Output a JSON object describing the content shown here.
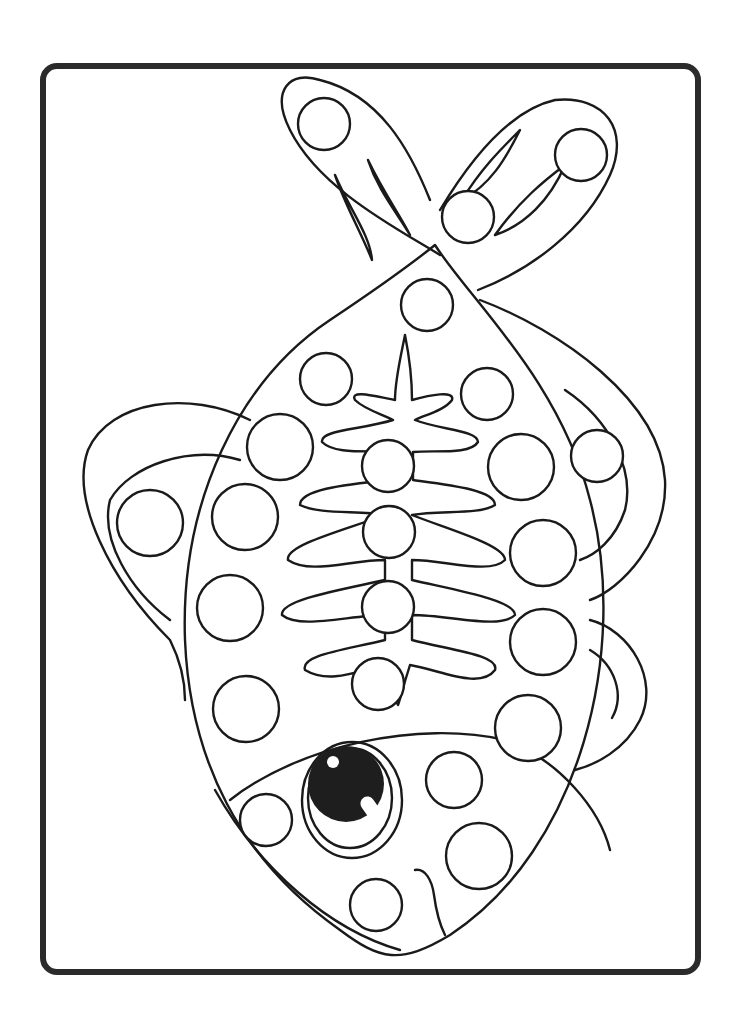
{
  "page": {
    "background": "#ffffff",
    "line_color": "#1a1a1a",
    "frame_color": "#2b2b2b"
  },
  "frame": {
    "x": 43,
    "y": 66,
    "width": 655,
    "height": 906,
    "radius": 14
  },
  "dots": [
    {
      "cx": 324,
      "cy": 124,
      "r": 26
    },
    {
      "cx": 581,
      "cy": 155,
      "r": 26
    },
    {
      "cx": 468,
      "cy": 217,
      "r": 26
    },
    {
      "cx": 427,
      "cy": 305,
      "r": 26
    },
    {
      "cx": 326,
      "cy": 379,
      "r": 26
    },
    {
      "cx": 487,
      "cy": 394,
      "r": 26
    },
    {
      "cx": 280,
      "cy": 447,
      "r": 33
    },
    {
      "cx": 521,
      "cy": 467,
      "r": 33
    },
    {
      "cx": 388,
      "cy": 466,
      "r": 26
    },
    {
      "cx": 597,
      "cy": 456,
      "r": 26
    },
    {
      "cx": 150,
      "cy": 523,
      "r": 33
    },
    {
      "cx": 245,
      "cy": 517,
      "r": 33
    },
    {
      "cx": 389,
      "cy": 532,
      "r": 26
    },
    {
      "cx": 543,
      "cy": 553,
      "r": 33
    },
    {
      "cx": 230,
      "cy": 608,
      "r": 33
    },
    {
      "cx": 388,
      "cy": 607,
      "r": 26
    },
    {
      "cx": 543,
      "cy": 642,
      "r": 33
    },
    {
      "cx": 378,
      "cy": 684,
      "r": 26
    },
    {
      "cx": 246,
      "cy": 709,
      "r": 33
    },
    {
      "cx": 528,
      "cy": 728,
      "r": 33
    },
    {
      "cx": 454,
      "cy": 780,
      "r": 28
    },
    {
      "cx": 266,
      "cy": 820,
      "r": 26
    },
    {
      "cx": 479,
      "cy": 856,
      "r": 33
    },
    {
      "cx": 376,
      "cy": 905,
      "r": 26
    }
  ]
}
